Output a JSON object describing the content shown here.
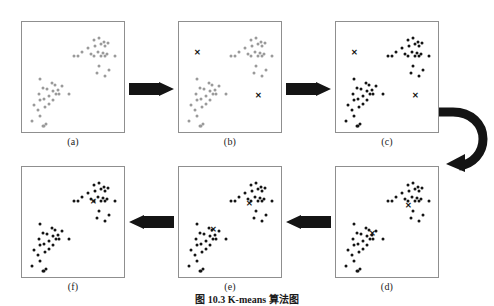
{
  "figure": {
    "caption": "图 10.3  K-means 算法图",
    "caption_top": 291,
    "point_radius": 1.5,
    "colors": {
      "point_unassigned": "#9a9a9a",
      "point_assigned": "#141414",
      "centroid": "#141414",
      "panel_border": "#8f8f8f",
      "arrow": "#141414",
      "background": "#ffffff"
    },
    "panels": [
      {
        "id": "a",
        "label": "(a)",
        "x": 21,
        "y": 21,
        "w": 104,
        "h": 112,
        "label_x": 21,
        "label_y": 136,
        "label_w": 104,
        "point_state": "gray",
        "centroids": []
      },
      {
        "id": "b",
        "label": "(b)",
        "x": 178,
        "y": 21,
        "w": 104,
        "h": 112,
        "label_x": 178,
        "label_y": 136,
        "label_w": 104,
        "point_state": "gray",
        "centroids": [
          [
            0.18,
            0.28
          ],
          [
            0.76,
            0.66
          ]
        ]
      },
      {
        "id": "c",
        "label": "(c)",
        "x": 335,
        "y": 21,
        "w": 104,
        "h": 112,
        "label_x": 335,
        "label_y": 136,
        "label_w": 104,
        "point_state": "dark",
        "centroids": [
          [
            0.18,
            0.28
          ],
          [
            0.76,
            0.66
          ]
        ]
      },
      {
        "id": "d",
        "label": "(d)",
        "x": 335,
        "y": 166,
        "w": 104,
        "h": 112,
        "label_x": 335,
        "label_y": 281,
        "label_w": 104,
        "point_state": "dark",
        "centroids": [
          [
            0.35,
            0.6
          ],
          [
            0.7,
            0.35
          ]
        ]
      },
      {
        "id": "e",
        "label": "(e)",
        "x": 178,
        "y": 166,
        "w": 104,
        "h": 112,
        "label_x": 178,
        "label_y": 281,
        "label_w": 104,
        "point_state": "dark",
        "centroids": [
          [
            0.33,
            0.56
          ],
          [
            0.68,
            0.33
          ]
        ]
      },
      {
        "id": "f",
        "label": "(f)",
        "x": 21,
        "y": 166,
        "w": 104,
        "h": 112,
        "label_x": 21,
        "label_y": 281,
        "label_w": 104,
        "point_state": "dark",
        "centroids": [
          [
            0.69,
            0.31
          ]
        ]
      }
    ],
    "points": [
      [
        0.095,
        0.885
      ],
      [
        0.175,
        0.84
      ],
      [
        0.2,
        0.93
      ],
      [
        0.215,
        0.925
      ],
      [
        0.235,
        0.915
      ],
      [
        0.15,
        0.79
      ],
      [
        0.12,
        0.745
      ],
      [
        0.175,
        0.7
      ],
      [
        0.225,
        0.76
      ],
      [
        0.21,
        0.69
      ],
      [
        0.26,
        0.73
      ],
      [
        0.255,
        0.66
      ],
      [
        0.3,
        0.7
      ],
      [
        0.245,
        0.6
      ],
      [
        0.3,
        0.62
      ],
      [
        0.33,
        0.64
      ],
      [
        0.345,
        0.605
      ],
      [
        0.36,
        0.64
      ],
      [
        0.285,
        0.545
      ],
      [
        0.32,
        0.56
      ],
      [
        0.38,
        0.575
      ],
      [
        0.455,
        0.645
      ],
      [
        0.205,
        0.585
      ],
      [
        0.16,
        0.64
      ],
      [
        0.63,
        0.235
      ],
      [
        0.69,
        0.165
      ],
      [
        0.7,
        0.215
      ],
      [
        0.745,
        0.14
      ],
      [
        0.76,
        0.195
      ],
      [
        0.79,
        0.175
      ],
      [
        0.8,
        0.21
      ],
      [
        0.83,
        0.185
      ],
      [
        0.66,
        0.29
      ],
      [
        0.695,
        0.3
      ],
      [
        0.735,
        0.265
      ],
      [
        0.76,
        0.3
      ],
      [
        0.775,
        0.28
      ],
      [
        0.8,
        0.3
      ],
      [
        0.815,
        0.29
      ],
      [
        0.5,
        0.3
      ],
      [
        0.54,
        0.305
      ],
      [
        0.575,
        0.27
      ],
      [
        0.89,
        0.3
      ],
      [
        0.745,
        0.39
      ],
      [
        0.72,
        0.455
      ],
      [
        0.84,
        0.43
      ],
      [
        0.8,
        0.48
      ],
      [
        0.175,
        0.505
      ]
    ],
    "arrows": [
      {
        "name": "arrow-a-to-b",
        "type": "straight",
        "direction": "right",
        "x": 129,
        "y": 82,
        "w": 45,
        "h": 14
      },
      {
        "name": "arrow-b-to-c",
        "type": "straight",
        "direction": "right",
        "x": 286,
        "y": 82,
        "w": 45,
        "h": 14
      },
      {
        "name": "arrow-c-to-d",
        "type": "curved",
        "direction": "down",
        "x": 437,
        "y": 106,
        "w": 52,
        "h": 66
      },
      {
        "name": "arrow-d-to-e",
        "type": "straight",
        "direction": "left",
        "x": 286,
        "y": 215,
        "w": 45,
        "h": 14
      },
      {
        "name": "arrow-e-to-f",
        "type": "straight",
        "direction": "left",
        "x": 129,
        "y": 215,
        "w": 45,
        "h": 14
      }
    ]
  }
}
